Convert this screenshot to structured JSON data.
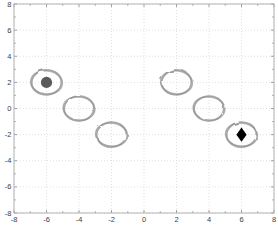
{
  "figure": {
    "width": 278,
    "height": 232,
    "background": "#ffffff"
  },
  "chart_data": {
    "type": "scatter",
    "title": "",
    "xlabel": "",
    "ylabel": "",
    "xlim": [
      -8,
      8
    ],
    "ylim": [
      -8,
      8
    ],
    "xticks": [
      -8,
      -6,
      -4,
      -2,
      0,
      2,
      4,
      6,
      8
    ],
    "yticks": [
      -8,
      -6,
      -4,
      -2,
      0,
      2,
      4,
      6,
      8
    ],
    "xtick_labels": [
      "-8",
      "-6",
      "-4",
      "-2",
      "0",
      "2",
      "4",
      "6",
      "8"
    ],
    "ytick_labels": [
      "-8",
      "-6",
      "-4",
      "-2",
      "0",
      "2",
      "4",
      "6",
      "8"
    ],
    "minor_ticks": [
      -7,
      -5,
      -3,
      -1,
      1,
      3,
      5,
      7
    ],
    "grid": "dotted",
    "legend": "none",
    "series": [
      {
        "name": "sketch-rings",
        "marker": "open-circle-sketch",
        "radius_data_units": 1,
        "color": "#878787",
        "points": [
          [
            -6,
            2
          ],
          [
            -4,
            0
          ],
          [
            -2,
            -2
          ],
          [
            2,
            2
          ],
          [
            4,
            0
          ],
          [
            6,
            -2
          ]
        ]
      },
      {
        "name": "filled-dot",
        "marker": "filled-circle",
        "color": "#5a5a5a",
        "points": [
          [
            -6,
            2
          ]
        ]
      },
      {
        "name": "filled-diamond",
        "marker": "filled-diamond",
        "color": "#000000",
        "points": [
          [
            6,
            -2
          ]
        ]
      }
    ]
  },
  "style": {
    "box_border_color": "#b3b3b3",
    "grid_color": "#d8d8d8",
    "tick_color": "#8a8a8a",
    "label_color": "#3d3d3d",
    "ring_color": "#878787",
    "dot_color": "#5a5a5a",
    "diamond_color": "#000000"
  }
}
